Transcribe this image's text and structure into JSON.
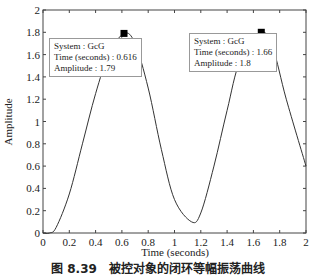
{
  "chart_data": {
    "type": "line",
    "title": "",
    "xlabel": "Time (seconds)",
    "ylabel": "Amplitude",
    "xlim": [
      0,
      2
    ],
    "ylim": [
      0,
      2
    ],
    "xticks": [
      "0",
      "0.2",
      "0.4",
      "0.6",
      "0.8",
      "1",
      "1.2",
      "1.4",
      "1.6",
      "1.8",
      "2"
    ],
    "yticks": [
      "0",
      "0.2",
      "0.4",
      "0.6",
      "0.8",
      "1",
      "1.2",
      "1.4",
      "1.6",
      "1.8",
      "2"
    ],
    "grid": false,
    "series": [
      {
        "name": "GcG",
        "x": [
          0,
          0.05,
          0.1,
          0.2,
          0.3,
          0.4,
          0.5,
          0.616,
          0.7,
          0.8,
          0.9,
          1.0,
          1.13,
          1.2,
          1.3,
          1.4,
          1.5,
          1.66,
          1.75,
          1.85,
          2.0
        ],
        "values": [
          0,
          0.0,
          0.05,
          0.35,
          0.8,
          1.25,
          1.6,
          1.79,
          1.7,
          1.3,
          0.75,
          0.3,
          0.1,
          0.18,
          0.6,
          1.1,
          1.55,
          1.8,
          1.65,
          1.2,
          0.6
        ]
      }
    ],
    "annotations": [
      {
        "system": "System : GcG",
        "time": "Time (seconds) : 0.616",
        "amplitude": "Amplitude : 1.79",
        "x": 0.616,
        "y": 1.79
      },
      {
        "system": "System : GcG",
        "time": "Time (seconds) : 1.66",
        "amplitude": "Amplitude : 1.8",
        "x": 1.66,
        "y": 1.8
      }
    ]
  },
  "caption": "图 8.39　被控对象的闭环等幅振荡曲线"
}
